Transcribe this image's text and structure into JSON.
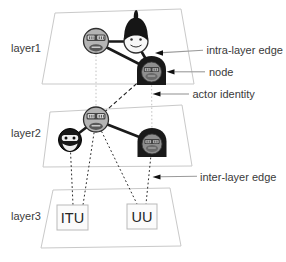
{
  "figure": {
    "layers": [
      {
        "label": "layer1"
      },
      {
        "label": "layer2"
      },
      {
        "label": "layer3"
      }
    ],
    "annotations": {
      "intra_layer_edge": "intra-layer edge",
      "node": "node",
      "actor_identity": "actor identity",
      "inter_layer_edge": "inter-layer edge"
    },
    "layer3_boxes": [
      {
        "label": "ITU"
      },
      {
        "label": "UU"
      }
    ],
    "icons": {
      "layer1_nodes": [
        "glasses-face-icon",
        "spiky-hair-face-icon",
        "hooded-face-icon"
      ],
      "layer2_nodes": [
        "glasses-face-icon",
        "beard-face-icon",
        "hooded-face-icon"
      ]
    },
    "colors": {
      "background": "#ffffff",
      "plane_border": "#c9c9c9",
      "edge": "#1a1a1a",
      "annotation_line": "#9a9a9a",
      "text": "#3a3a3a"
    }
  }
}
